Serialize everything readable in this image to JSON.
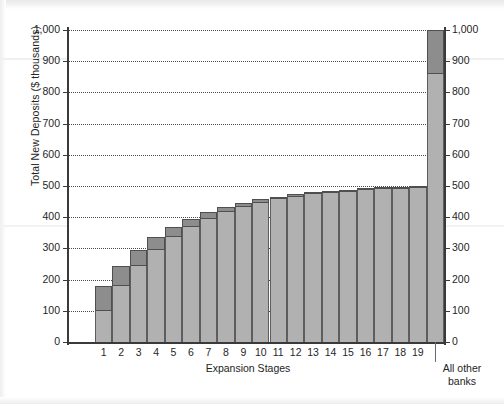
{
  "axes": {
    "y_title": "Total New Deposits ($ thousands)",
    "x_title": "Expansion Stages",
    "right_category": "All other banks",
    "right_category_line1": "All other",
    "right_category_line2": "banks",
    "y_ticks": [
      "1,000",
      "900",
      "800",
      "700",
      "600",
      "500",
      "400",
      "300",
      "200",
      "100",
      "0"
    ],
    "y_ticks_right": [
      "1,000",
      "900",
      "800",
      "700",
      "600",
      "500",
      "400",
      "300",
      "200",
      "100",
      "0"
    ]
  },
  "colors": {
    "increment_fill": "#8d8d8d",
    "cumulative_fill": "#b1b1b1",
    "bar_outline": "#4f4f4f",
    "axis": "#3a3a3a",
    "gridline": "#4a4a4a",
    "text": "#1f1f1f",
    "background": "#ffffff"
  },
  "chart_data": {
    "type": "bar",
    "title": "",
    "subtitle": "",
    "xlabel": "Expansion Stages",
    "ylabel": "Total New Deposits ($ thousands)",
    "ylim": [
      0,
      1000
    ],
    "ytick_step": 100,
    "grid": true,
    "legend": null,
    "stacked": true,
    "categories": [
      "1",
      "2",
      "3",
      "4",
      "5",
      "6",
      "7",
      "8",
      "9",
      "10",
      "11",
      "12",
      "13",
      "14",
      "15",
      "16",
      "17",
      "18",
      "19",
      "All other banks"
    ],
    "series": [
      {
        "name": "Deposits carried over from previous stage",
        "values": [
          100,
          180,
          244,
          295,
          336,
          369,
          395,
          416,
          433,
          446,
          457,
          466,
          473,
          478,
          482,
          486,
          489,
          491,
          493,
          860
        ]
      },
      {
        "name": "New deposits created at this stage",
        "values": [
          80,
          64,
          51,
          41,
          33,
          26,
          21,
          17,
          13,
          11,
          9,
          7,
          5,
          4,
          4,
          3,
          2,
          2,
          1,
          140
        ]
      }
    ],
    "cumulative_totals": [
      180,
      244,
      295,
      336,
      369,
      395,
      416,
      433,
      446,
      457,
      466,
      473,
      478,
      482,
      486,
      489,
      491,
      493,
      494,
      1000
    ],
    "annotations": []
  }
}
